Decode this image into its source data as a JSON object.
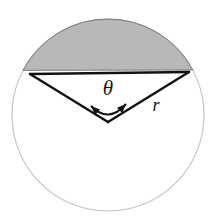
{
  "figure": {
    "name": "circular-segment-diagram",
    "background_color": "#ffffff",
    "width": 213,
    "height": 222
  },
  "circle": {
    "name": "circle-outline",
    "center_x": 108,
    "center_y": 115,
    "radius": 96,
    "stroke_color": "#c2c2c2",
    "stroke_width": 1.1,
    "fill_color": "#ffffff"
  },
  "segment": {
    "name": "shaded-circular-segment",
    "fill_color": "#b8b8b8",
    "stroke_color": "#7a7a7a",
    "stroke_width": 1,
    "description": "shaded region between chord and major upper arc"
  },
  "chord": {
    "name": "chord-line",
    "x1": 30,
    "y1": 74,
    "x2": 189,
    "y2": 72,
    "stroke_color": "#111111",
    "stroke_width": 2.4
  },
  "radii": [
    {
      "name": "radius-left",
      "x1": 108,
      "y1": 122,
      "x2": 30,
      "y2": 74,
      "stroke_color": "#111111",
      "stroke_width": 2.4
    },
    {
      "name": "radius-right",
      "x1": 108,
      "y1": 122,
      "x2": 189,
      "y2": 72,
      "stroke_color": "#111111",
      "stroke_width": 2.4
    }
  ],
  "angle_arc": {
    "name": "angle-arc-double-arrow",
    "stroke_color": "#111111",
    "stroke_width": 2,
    "arrowheads": [
      "left-arrowhead",
      "right-arrowhead"
    ],
    "start_x": 91,
    "start_y": 106,
    "end_x": 126,
    "end_y": 104,
    "sweep_peak_y": 116
  },
  "labels": {
    "theta": {
      "text": "θ",
      "x": 108,
      "y": 95,
      "font_size": 21,
      "color": "#161616"
    },
    "radius": {
      "text": "r",
      "x": 156,
      "y": 111,
      "font_size": 18,
      "color": "#161616"
    }
  }
}
